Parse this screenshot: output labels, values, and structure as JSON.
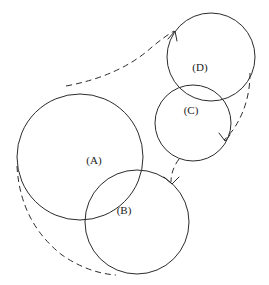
{
  "figure": {
    "canvas": {
      "width": 269,
      "height": 285,
      "background": "#ffffff"
    },
    "stroke_color": "#2b2b2b",
    "label_color": "#1a1a1a"
  },
  "circles": [
    {
      "id": "A",
      "label": "(A)",
      "cx": 80,
      "cy": 157,
      "r": 63,
      "label_x": 94,
      "label_y": 161
    },
    {
      "id": "B",
      "label": "(B)",
      "cx": 137,
      "cy": 222,
      "r": 52,
      "label_x": 124,
      "label_y": 211
    },
    {
      "id": "C",
      "label": "(C)",
      "cx": 193,
      "cy": 123,
      "r": 38,
      "label_x": 191,
      "label_y": 111
    },
    {
      "id": "D",
      "label": "(D)",
      "cx": 211,
      "cy": 57,
      "r": 44,
      "label_x": 200,
      "label_y": 68
    }
  ],
  "dashed_arcs": [
    {
      "id": "arc-top",
      "name": "arc-A-to-D",
      "path": "M 66 86 Q 120 76 152 47 Q 164 37 174 31",
      "has_arrow": false
    },
    {
      "id": "arc-left",
      "name": "arc-A-to-B",
      "path": "M 17 166 Q 20 222 62 255 Q 88 273 116 275",
      "has_arrow": false
    },
    {
      "id": "arc-right",
      "name": "arc-D-to-C",
      "path": "M 250 73 Q 250 105 233 130 Q 228 136 224 140",
      "has_arrow": true,
      "arrow_path": "M 220 134 L 224 141 L 229 137"
    },
    {
      "id": "arc-middle",
      "name": "arc-C-to-B",
      "path": "M 179 159 Q 171 170 171 182",
      "has_arrow": true,
      "arrow_path": "M 165 178 L 172 184 L 178 178"
    },
    {
      "id": "arrow-top-d",
      "name": "arrow-into-D",
      "path": "",
      "has_arrow": true,
      "arrow_path": "M 168 39 L 175 31 L 177 40"
    }
  ]
}
